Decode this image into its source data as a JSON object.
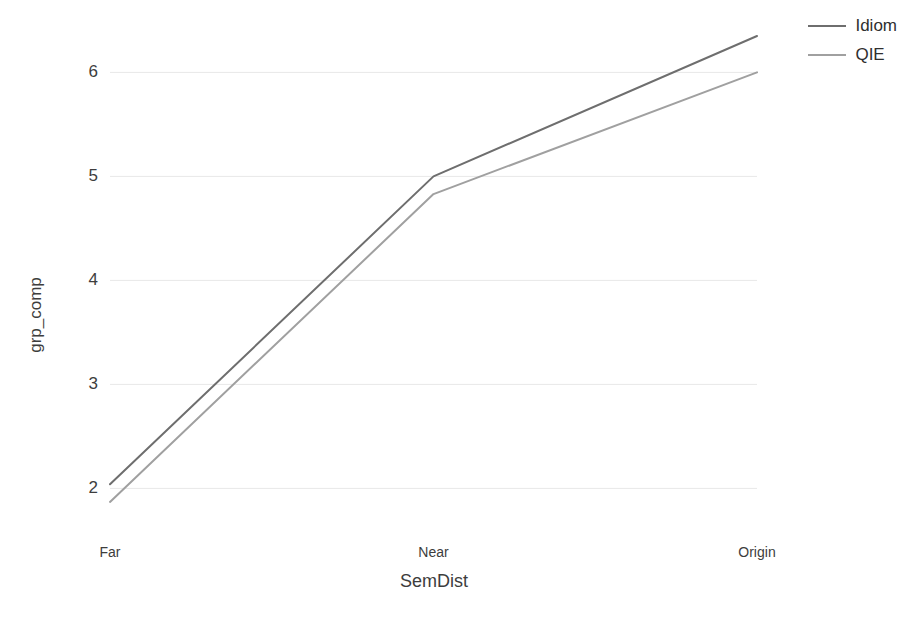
{
  "chart_data": {
    "type": "line",
    "title": "",
    "xlabel": "SemDist",
    "ylabel": "grp_comp",
    "categories": [
      "Far",
      "Near",
      "Origin"
    ],
    "series": [
      {
        "name": "Idiom",
        "values": [
          2.04,
          5.0,
          6.35
        ],
        "color": "#6e6e6e"
      },
      {
        "name": "QIE",
        "values": [
          1.87,
          4.83,
          6.0
        ],
        "color": "#a0a0a0"
      }
    ],
    "y_ticks": [
      2,
      3,
      4,
      5,
      6
    ],
    "y_tick_labels": [
      "2",
      "3",
      "4",
      "5",
      "6"
    ],
    "ylim": [
      1.6,
      6.6
    ],
    "grid": true,
    "grid_axis": "y",
    "grid_color": "#e8e8e8",
    "legend_position": "top-right",
    "background": "#ffffff"
  },
  "axes": {
    "y_title": "grp_comp",
    "x_title": "SemDist",
    "x_tick_labels": [
      "Far",
      "Near",
      "Origin"
    ],
    "y_tick_labels": [
      "2",
      "3",
      "4",
      "5",
      "6"
    ]
  },
  "legend": {
    "items": [
      {
        "label": "Idiom"
      },
      {
        "label": "QIE"
      }
    ]
  }
}
